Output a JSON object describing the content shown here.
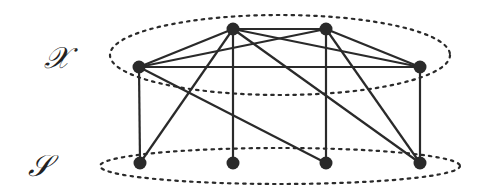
{
  "labels": {
    "top_set": "𝒳",
    "bottom_set": "𝒮"
  },
  "colors": {
    "ink": "#2a2a2a",
    "background": "#ffffff"
  },
  "graph": {
    "top_nodes": [
      {
        "id": "x1",
        "x": 139,
        "y": 67
      },
      {
        "id": "x2",
        "x": 233,
        "y": 29
      },
      {
        "id": "x3",
        "x": 326,
        "y": 29
      },
      {
        "id": "x4",
        "x": 420,
        "y": 67
      }
    ],
    "bottom_nodes": [
      {
        "id": "s1",
        "x": 140,
        "y": 163
      },
      {
        "id": "s2",
        "x": 233,
        "y": 163
      },
      {
        "id": "s3",
        "x": 326,
        "y": 163
      },
      {
        "id": "s4",
        "x": 420,
        "y": 163
      }
    ],
    "edges": [
      [
        "x1",
        "x2"
      ],
      [
        "x1",
        "x3"
      ],
      [
        "x1",
        "x4"
      ],
      [
        "x2",
        "x3"
      ],
      [
        "x2",
        "x4"
      ],
      [
        "x3",
        "x4"
      ],
      [
        "x1",
        "s1"
      ],
      [
        "x1",
        "s3"
      ],
      [
        "x2",
        "s1"
      ],
      [
        "x2",
        "s2"
      ],
      [
        "x2",
        "s4"
      ],
      [
        "x3",
        "s3"
      ],
      [
        "x3",
        "s4"
      ],
      [
        "x4",
        "s4"
      ]
    ],
    "ellipses": [
      {
        "name": "top-set-ellipse",
        "cx": 280,
        "cy": 55,
        "rx": 170,
        "ry": 40
      },
      {
        "name": "bottom-set-ellipse",
        "cx": 280,
        "cy": 166,
        "rx": 180,
        "ry": 18
      }
    ]
  }
}
